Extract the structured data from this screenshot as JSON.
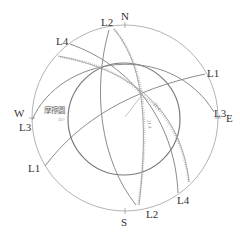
{
  "diagram": {
    "title": "",
    "compass": {
      "north": "N",
      "south": "S",
      "east": "E",
      "west": "W"
    },
    "great_circles": [
      {
        "id": "L1",
        "label_start": "L1",
        "label_end": "L1"
      },
      {
        "id": "L2",
        "label_start": "L2",
        "label_end": "L2"
      },
      {
        "id": "L3",
        "label_start": "L3",
        "label_end": "L3"
      },
      {
        "id": "L4",
        "label_start": "L4",
        "label_end": "L4"
      }
    ],
    "friction_circle": {
      "label": "摩擦圆",
      "angle": "35°"
    },
    "intersection_labels": [
      "31.4",
      "31.4"
    ],
    "colors": {
      "primitive": "#b3b3b3",
      "great_circle": "#8c8c8c",
      "friction": "#7a7a7a",
      "text": "#333333"
    }
  }
}
